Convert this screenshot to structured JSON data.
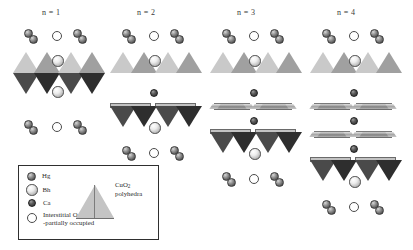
{
  "figure": {
    "type": "crystal-structure-diagram",
    "columns": [
      {
        "header": "n = 1"
      },
      {
        "header": "n = 2"
      },
      {
        "header": "n = 3"
      },
      {
        "header": "n = 4"
      }
    ]
  },
  "legend": {
    "items": [
      {
        "symbol": "hg-sphere",
        "label": "Hg"
      },
      {
        "symbol": "ba-sphere",
        "label": "Bh"
      },
      {
        "symbol": "ca-sphere",
        "label": "Ca"
      },
      {
        "symbol": "open-circle",
        "label": "Interstitial O (δ)",
        "label2": "-partially occupied"
      }
    ],
    "polyhedra_caption_line1": "CuO",
    "polyhedra_caption_sub": "2",
    "polyhedra_caption_line2": "polyhedra"
  },
  "colors": {
    "ink": "#2b2b2b",
    "hg": "#5e5e5e",
    "ba": "#ececec",
    "ca": "#2a2a2a",
    "oxygen": "#ffffff",
    "polyhedra_light": "#c4c4c4",
    "polyhedra_dark": "#2e2e2e",
    "legend_border": "#2f2f2f",
    "background": "#ffffff"
  }
}
